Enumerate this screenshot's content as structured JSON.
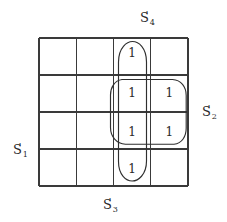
{
  "figure": {
    "type": "karnaugh-map",
    "rows": 4,
    "columns": 4,
    "ink_color": "#3a3a3a",
    "background_color": "#ffffff"
  },
  "labels": {
    "top": {
      "base": "S",
      "prime": "'",
      "subscript": "4"
    },
    "right": {
      "base": "S",
      "prime": "'",
      "subscript": "2"
    },
    "left": {
      "base": "S",
      "prime": "'",
      "subscript": "1"
    },
    "bottom": {
      "base": "S",
      "prime": "'",
      "subscript": "3"
    }
  },
  "cells": [
    {
      "row": 1,
      "col": 3,
      "value": "1"
    },
    {
      "row": 2,
      "col": 3,
      "value": "1"
    },
    {
      "row": 2,
      "col": 4,
      "value": "1"
    },
    {
      "row": 3,
      "col": 3,
      "value": "1"
    },
    {
      "row": 3,
      "col": 4,
      "value": "1"
    },
    {
      "row": 4,
      "col": 3,
      "value": "1"
    }
  ],
  "groups": [
    {
      "name": "vertical-column-group",
      "shape": "oval",
      "rows": [
        1,
        2,
        3,
        4
      ],
      "cols": [
        3
      ]
    },
    {
      "name": "square-block-group",
      "shape": "rounded-rectangle",
      "rows": [
        2,
        3
      ],
      "cols": [
        3,
        4
      ]
    }
  ]
}
